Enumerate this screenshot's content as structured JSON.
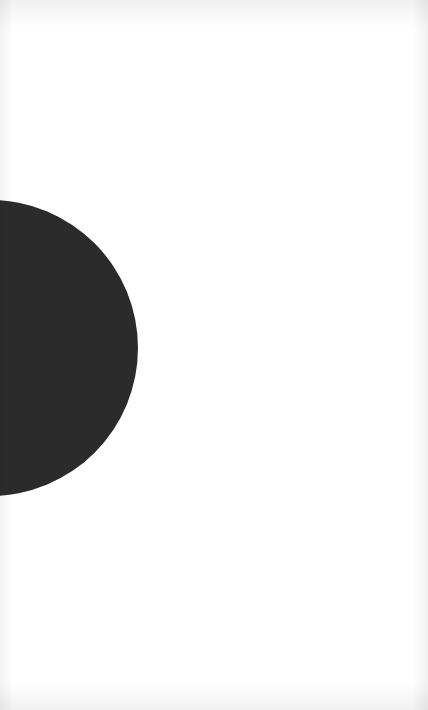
{
  "canvas": {
    "width": 428,
    "height": 710,
    "background_color": "#ffffff"
  },
  "shape": {
    "type": "circle",
    "color": "#2b2b2b",
    "visible_portion": "right half, clipped at left edge",
    "center_x": -10,
    "center_y": 348,
    "radius": 148
  }
}
